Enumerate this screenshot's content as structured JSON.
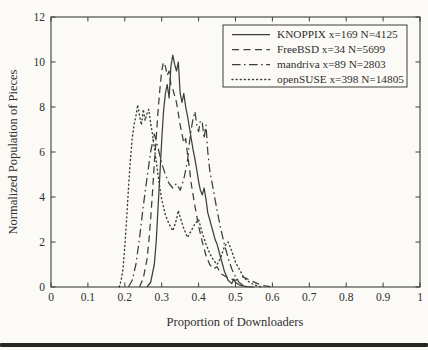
{
  "chart_data": {
    "type": "line",
    "title": "",
    "xlabel": "Proportion of Downloaders",
    "ylabel": "Normalized Population of Pieces",
    "xlim": [
      0,
      1
    ],
    "ylim": [
      0,
      12
    ],
    "xtick_values": [
      0,
      0.1,
      0.2,
      0.3,
      0.4,
      0.5,
      0.6,
      0.7,
      0.8,
      0.9,
      1
    ],
    "xtick_labels": [
      "0",
      "0.1",
      "0.2",
      "0.3",
      "0.4",
      "0.5",
      "0.6",
      "0.7",
      "0.8",
      "0.9",
      "1"
    ],
    "ytick_values": [
      0,
      2,
      4,
      6,
      8,
      10,
      12
    ],
    "ytick_labels": [
      "0",
      "2",
      "4",
      "6",
      "8",
      "10",
      "12"
    ],
    "grid": false,
    "legend_position": "top-right",
    "ink_color": "#3d3d3d",
    "paper_color": "#fbfaf6",
    "series": [
      {
        "name": "KNOPPIX x=169 N=4125",
        "style": "solid",
        "x": [
          0.26,
          0.27,
          0.28,
          0.285,
          0.29,
          0.295,
          0.3,
          0.305,
          0.31,
          0.315,
          0.32,
          0.325,
          0.33,
          0.335,
          0.34,
          0.345,
          0.35,
          0.355,
          0.36,
          0.365,
          0.37,
          0.375,
          0.38,
          0.385,
          0.39,
          0.395,
          0.4,
          0.405,
          0.41,
          0.415,
          0.42,
          0.425,
          0.43,
          0.435,
          0.44,
          0.445,
          0.45,
          0.455,
          0.46,
          0.465,
          0.47,
          0.475,
          0.48,
          0.49,
          0.495,
          0.5,
          0.51,
          0.52,
          0.53,
          0.55
        ],
        "y": [
          0,
          0.2,
          1.0,
          2.0,
          3.5,
          5.0,
          6.5,
          7.8,
          8.6,
          9.0,
          8.4,
          9.8,
          10.3,
          9.9,
          9.6,
          10.0,
          8.6,
          8.2,
          8.6,
          8.0,
          7.6,
          7.1,
          6.6,
          6.1,
          5.7,
          5.2,
          4.7,
          4.3,
          4.1,
          4.4,
          3.9,
          3.3,
          3.0,
          2.7,
          2.4,
          2.1,
          1.9,
          1.6,
          1.3,
          1.0,
          0.7,
          0.5,
          0.3,
          0.15,
          0.35,
          0.2,
          0.1,
          0.05,
          0.02,
          0
        ]
      },
      {
        "name": "FreeBSD x=34 N=5699",
        "style": "dashed",
        "x": [
          0.24,
          0.25,
          0.26,
          0.265,
          0.27,
          0.275,
          0.28,
          0.285,
          0.29,
          0.295,
          0.3,
          0.305,
          0.31,
          0.315,
          0.32,
          0.325,
          0.33,
          0.34,
          0.35,
          0.36,
          0.365,
          0.37,
          0.375,
          0.38,
          0.39,
          0.4,
          0.41,
          0.42,
          0.43,
          0.44,
          0.45,
          0.46,
          0.47,
          0.48,
          0.5,
          0.52,
          0.54,
          0.56,
          0.58,
          0.6
        ],
        "y": [
          0,
          0.4,
          1.2,
          2.0,
          3.0,
          4.2,
          5.5,
          6.6,
          7.8,
          8.8,
          9.6,
          10.0,
          9.8,
          9.4,
          9.6,
          9.0,
          8.8,
          8.2,
          7.2,
          6.4,
          6.6,
          5.9,
          5.3,
          4.6,
          3.6,
          2.7,
          2.0,
          1.4,
          1.0,
          0.8,
          0.9,
          0.6,
          0.5,
          0.4,
          0.3,
          0.45,
          0.3,
          0.15,
          0.05,
          0
        ]
      },
      {
        "name": "mandriva x=89 N=2803",
        "style": "dashdot",
        "x": [
          0.21,
          0.22,
          0.23,
          0.24,
          0.25,
          0.26,
          0.27,
          0.28,
          0.29,
          0.3,
          0.31,
          0.32,
          0.33,
          0.34,
          0.35,
          0.36,
          0.37,
          0.375,
          0.38,
          0.385,
          0.39,
          0.395,
          0.4,
          0.405,
          0.41,
          0.415,
          0.42,
          0.425,
          0.43,
          0.44,
          0.45,
          0.46,
          0.47,
          0.48,
          0.49,
          0.5,
          0.51,
          0.52,
          0.53
        ],
        "y": [
          0,
          0.3,
          1.0,
          2.2,
          3.6,
          4.8,
          6.0,
          6.8,
          6.2,
          5.5,
          5.0,
          4.6,
          4.4,
          4.6,
          4.3,
          4.8,
          5.6,
          6.4,
          7.0,
          7.5,
          7.8,
          7.2,
          6.9,
          7.4,
          7.3,
          6.6,
          7.2,
          6.0,
          5.2,
          4.3,
          3.4,
          2.6,
          1.9,
          1.3,
          0.8,
          0.45,
          0.2,
          0.08,
          0
        ]
      },
      {
        "name": "openSUSE x=398 N=14805",
        "style": "dotted",
        "x": [
          0.185,
          0.19,
          0.195,
          0.2,
          0.205,
          0.21,
          0.215,
          0.22,
          0.225,
          0.23,
          0.235,
          0.24,
          0.245,
          0.25,
          0.255,
          0.26,
          0.265,
          0.27,
          0.275,
          0.28,
          0.285,
          0.29,
          0.295,
          0.3,
          0.31,
          0.32,
          0.33,
          0.34,
          0.345,
          0.35,
          0.36,
          0.37,
          0.38,
          0.39,
          0.4,
          0.41,
          0.42,
          0.43,
          0.44,
          0.45,
          0.46,
          0.47,
          0.48,
          0.49,
          0.5,
          0.51,
          0.52,
          0.53,
          0.55,
          0.57
        ],
        "y": [
          0,
          0.3,
          0.8,
          1.8,
          3.0,
          4.4,
          5.6,
          6.6,
          7.2,
          7.6,
          8.1,
          7.6,
          7.2,
          7.9,
          7.4,
          7.7,
          7.9,
          7.3,
          6.8,
          6.2,
          5.6,
          5.0,
          4.4,
          3.9,
          3.2,
          2.8,
          2.5,
          3.0,
          3.4,
          3.1,
          2.6,
          2.2,
          2.5,
          2.8,
          3.0,
          2.4,
          1.9,
          1.5,
          1.2,
          1.0,
          1.3,
          1.8,
          2.0,
          1.6,
          1.1,
          0.8,
          0.5,
          0.3,
          0.1,
          0
        ]
      }
    ]
  }
}
